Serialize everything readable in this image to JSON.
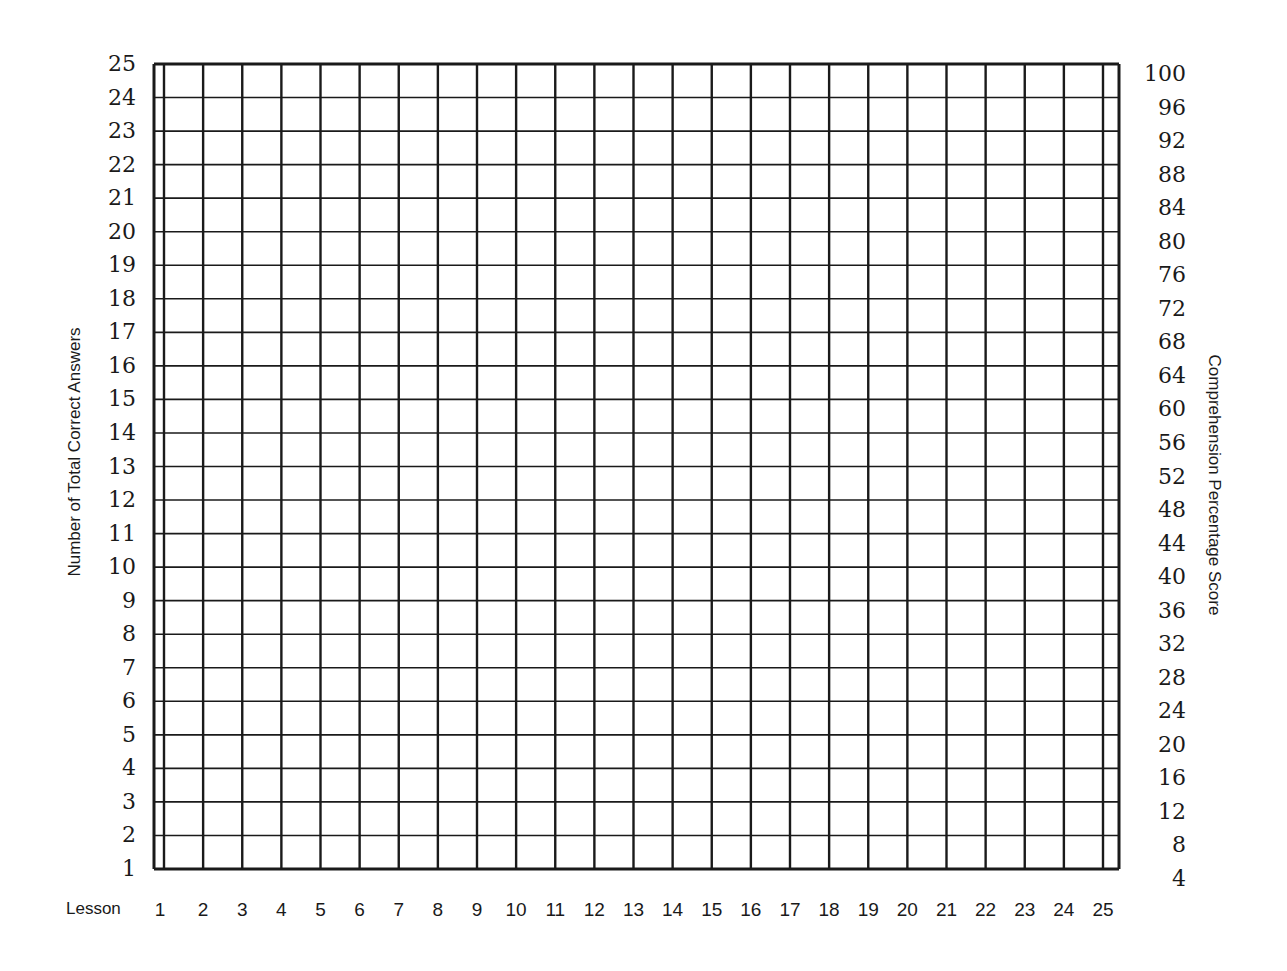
{
  "chart_data": {
    "type": "line",
    "title": "",
    "xlabel": "Lesson",
    "ylabel": "Number of Total Correct Answers",
    "ylabel_right": "Comprehension Percentage Score",
    "x": [
      1,
      2,
      3,
      4,
      5,
      6,
      7,
      8,
      9,
      10,
      11,
      12,
      13,
      14,
      15,
      16,
      17,
      18,
      19,
      20,
      21,
      22,
      23,
      24,
      25
    ],
    "ylim": [
      1,
      25
    ],
    "ylim_right": [
      4,
      100
    ],
    "yticks_left": [
      "25",
      "24",
      "23",
      "22",
      "21",
      "20",
      "19",
      "18",
      "17",
      "16",
      "15",
      "14",
      "13",
      "12",
      "11",
      "10",
      "9",
      "8",
      "7",
      "6",
      "5",
      "4",
      "3",
      "2",
      "1"
    ],
    "yticks_right": [
      "100",
      "96",
      "92",
      "88",
      "84",
      "80",
      "76",
      "72",
      "68",
      "64",
      "60",
      "56",
      "52",
      "48",
      "44",
      "40",
      "36",
      "32",
      "28",
      "24",
      "20",
      "16",
      "12",
      "8",
      "4"
    ],
    "xticks": [
      "1",
      "2",
      "3",
      "4",
      "5",
      "6",
      "7",
      "8",
      "9",
      "10",
      "11",
      "12",
      "13",
      "14",
      "15",
      "16",
      "17",
      "18",
      "19",
      "20",
      "21",
      "22",
      "23",
      "24",
      "25"
    ],
    "series": [],
    "grid": true,
    "legend": null,
    "note": "Blank progress chart grid; no data plotted"
  },
  "labels": {
    "lesson": "Lesson",
    "left_axis": "Number of Total Correct Answers",
    "right_axis": "Comprehension Percentage Score"
  },
  "colors": {
    "grid_line": "#1a1a1a",
    "background": "#ffffff",
    "text": "#1a1a1a"
  }
}
